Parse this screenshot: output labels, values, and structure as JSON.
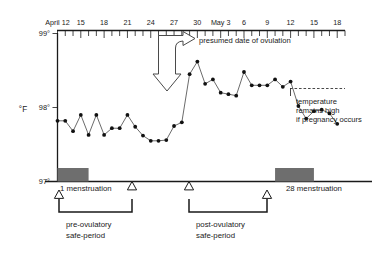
{
  "chart_data": {
    "type": "line",
    "title": "",
    "xlabel": "",
    "ylabel": "°F",
    "ylim": [
      97,
      99
    ],
    "ytick_labels": [
      "99°",
      "98°",
      "97°"
    ],
    "ytick_values": [
      99,
      98,
      97
    ],
    "grid": false,
    "legend": null,
    "x_axis_position": "top",
    "xtick_labels": [
      "April 12",
      "15",
      "18",
      "21",
      "24",
      "27",
      "30",
      "May 3",
      "6",
      "9",
      "12",
      "15",
      "18"
    ],
    "xtick_values": [
      12,
      15,
      18,
      21,
      24,
      27,
      30,
      33,
      36,
      39,
      42,
      45,
      48
    ],
    "minor_tick_interval_days": 1,
    "x_range_days": [
      12,
      49
    ],
    "series": [
      {
        "name": "basal body temperature",
        "unit": "°F",
        "x": [
          12,
          13,
          14,
          15,
          16,
          17,
          18,
          19,
          20,
          21,
          22,
          23,
          24,
          25,
          26,
          27,
          28,
          29,
          30,
          31,
          32,
          33,
          34,
          35,
          36,
          37,
          38,
          39,
          40,
          41,
          42,
          43,
          44,
          45,
          46,
          47,
          48
        ],
        "values": [
          97.82,
          97.82,
          97.68,
          97.9,
          97.63,
          97.9,
          97.63,
          97.72,
          97.72,
          97.9,
          97.74,
          97.62,
          97.55,
          97.55,
          97.56,
          97.75,
          97.8,
          98.45,
          98.62,
          98.32,
          98.38,
          98.2,
          98.18,
          98.16,
          98.48,
          98.3,
          98.3,
          98.3,
          98.38,
          98.28,
          98.35,
          98.02,
          97.85,
          97.95,
          97.97,
          97.92,
          97.78
        ]
      }
    ],
    "annotations": {
      "ovulation": {
        "label": "presumed date of ovulation",
        "day": 26
      },
      "pregnancy_note": {
        "label_lines": [
          "temperature",
          "remains high",
          "if pregnancy occurs"
        ],
        "reference_level": 98.3
      }
    },
    "menstruation_bars": [
      {
        "label": "1 menstruation",
        "cycle_day_label": "1",
        "start_day": 12,
        "end_day": 16
      },
      {
        "label": "28 menstruation",
        "cycle_day_label": "28",
        "start_day": 40,
        "end_day": 45
      }
    ],
    "safe_periods": [
      {
        "label_lines": [
          "pre-ovulatory",
          "safe-period"
        ],
        "start_day": 12,
        "end_day": 20
      },
      {
        "label_lines": [
          "post-ovulatory",
          "safe-period"
        ],
        "start_day": 31,
        "end_day": 40
      }
    ]
  },
  "labels": {
    "y_axis_title": "°F",
    "y_top": "99°",
    "y_mid": "98°",
    "y_bottom": "97°",
    "x_first": "April 12",
    "x_t15": "15",
    "x_t18": "18",
    "x_t21": "21",
    "x_t24": "24",
    "x_t27": "27",
    "x_t30": "30",
    "x_may3": "May 3",
    "x_t6": "6",
    "x_t9": "9",
    "x_t12": "12",
    "x_t15b": "15",
    "x_t18b": "18",
    "ovulation_text": "presumed date of ovulation",
    "note_line1": "temperature",
    "note_line2": "remains high",
    "note_line3": "if pregnancy occurs",
    "mens_left": "1 menstruation",
    "mens_right": "28 menstruation",
    "pre_safe_1": "pre-ovulatory",
    "pre_safe_2": "safe-period",
    "post_safe_1": "post-ovulatory",
    "post_safe_2": "safe-period"
  },
  "colors": {
    "ink": "#1a1a1a",
    "bar_fill": "#6e6e6e",
    "series_stroke": "#3a3a3a",
    "dot_fill": "#111111",
    "background": "#ffffff"
  }
}
